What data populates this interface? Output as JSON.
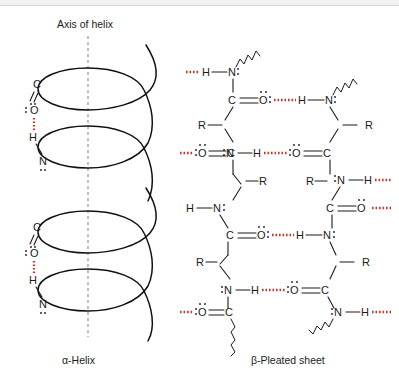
{
  "figure": {
    "title_axis": "Axis of helix",
    "caption_left": "α-Helix",
    "caption_right": "β-Pleated sheet",
    "colors": {
      "hydrogen_bond": "#c0392b",
      "bond": "#1a1a1a",
      "axis_line": "#8a8a8a",
      "background": "#ffffff",
      "topbar": "#f2f2f2"
    }
  },
  "alpha_helix": {
    "name": "alpha-helix",
    "axis_label": "Axis of helix",
    "caption": "α-Helix",
    "turns": 3,
    "hydrogen_bonds": 2,
    "atoms_upper": [
      {
        "label": "C",
        "x": 37,
        "y": 84
      },
      {
        "label": "O",
        "x": 33,
        "y": 107,
        "lone_pairs": true
      },
      {
        "label": "H",
        "x": 33,
        "y": 133
      },
      {
        "label": "N",
        "x": 37,
        "y": 157,
        "lone_pairs": true
      }
    ],
    "atoms_lower": [
      {
        "label": "C",
        "x": 37,
        "y": 227
      },
      {
        "label": "O",
        "x": 33,
        "y": 250,
        "lone_pairs": true
      },
      {
        "label": "H",
        "x": 33,
        "y": 276
      },
      {
        "label": "N",
        "x": 37,
        "y": 300,
        "lone_pairs": true
      }
    ]
  },
  "beta_sheet": {
    "name": "beta-pleated-sheet",
    "caption": "β-Pleated sheet",
    "strands": 2,
    "interchain_hydrogen_bonds": 4,
    "terminal_hydrogen_bonds": 6,
    "atom_labels": {
      "carbon": "C",
      "oxygen": "O",
      "nitrogen": "N",
      "hydrogen": "H",
      "side_chain": "R"
    },
    "left_strand_atoms": [
      {
        "label": "H",
        "x": 208,
        "y": 71
      },
      {
        "label": "N",
        "x": 233,
        "y": 71,
        "lone_pairs": true
      },
      {
        "label": "C",
        "x": 233,
        "y": 100
      },
      {
        "label": "O",
        "x": 265,
        "y": 100,
        "lone_pairs": true
      },
      {
        "label": "R",
        "x": 203,
        "y": 124
      },
      {
        "label": "N",
        "x": 233,
        "y": 153,
        "lone_pairs": true
      },
      {
        "label": "O",
        "x": 200,
        "y": 153,
        "lone_pairs": true
      },
      {
        "label": "C",
        "x": 233,
        "y": 153
      },
      {
        "label": "R",
        "x": 263,
        "y": 180
      },
      {
        "label": "H",
        "x": 196,
        "y": 208
      },
      {
        "label": "N",
        "x": 222,
        "y": 208,
        "lone_pairs": true
      },
      {
        "label": "C",
        "x": 233,
        "y": 235
      },
      {
        "label": "O",
        "x": 265,
        "y": 235,
        "lone_pairs": true
      },
      {
        "label": "R",
        "x": 203,
        "y": 262
      },
      {
        "label": "N",
        "x": 233,
        "y": 290,
        "lone_pairs": true
      },
      {
        "label": "O",
        "x": 200,
        "y": 300,
        "lone_pairs": true
      },
      {
        "label": "C",
        "x": 233,
        "y": 300
      }
    ],
    "right_strand_atoms": [
      {
        "label": "H",
        "x": 318,
        "y": 100
      },
      {
        "label": "N",
        "x": 344,
        "y": 100,
        "lone_pairs": true
      },
      {
        "label": "R",
        "x": 374,
        "y": 124
      },
      {
        "label": "N",
        "x": 344,
        "y": 153,
        "lone_pairs": true
      },
      {
        "label": "H",
        "x": 370,
        "y": 153
      },
      {
        "label": "C",
        "x": 344,
        "y": 180
      },
      {
        "label": "O",
        "x": 372,
        "y": 180,
        "lone_pairs": true
      },
      {
        "label": "R",
        "x": 314,
        "y": 208
      },
      {
        "label": "N",
        "x": 344,
        "y": 235,
        "lone_pairs": true
      },
      {
        "label": "H",
        "x": 370,
        "y": 235
      },
      {
        "label": "C",
        "x": 344,
        "y": 262
      },
      {
        "label": "O",
        "x": 372,
        "y": 262,
        "lone_pairs": true
      },
      {
        "label": "N",
        "x": 344,
        "y": 290,
        "lone_pairs": true
      },
      {
        "label": "H",
        "x": 370,
        "y": 290
      }
    ]
  }
}
